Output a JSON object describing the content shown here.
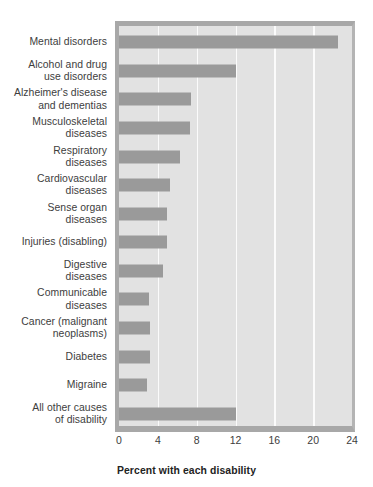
{
  "chart_data": {
    "type": "bar",
    "orientation": "horizontal",
    "title": "",
    "xlabel": "Percent with each disability",
    "ylabel": "",
    "xlim": [
      0,
      24
    ],
    "xticks": [
      0,
      4,
      8,
      12,
      16,
      20,
      24
    ],
    "xtick_labels": [
      "0",
      "4",
      "8",
      "12",
      "16",
      "20",
      "24"
    ],
    "grid": true,
    "grid_axis": "x",
    "legend": false,
    "categories": [
      "Mental disorders",
      "Alcohol and drug\nuse disorders",
      "Alzheimer's disease\nand dementias",
      "Musculoskeletal\ndiseases",
      "Respiratory\ndiseases",
      "Cardiovascular\ndiseases",
      "Sense organ\ndiseases",
      "Injuries (disabling)",
      "Digestive\ndiseases",
      "Communicable\ndiseases",
      "Cancer (malignant\nneoplasms)",
      "Diabetes",
      "Migraine",
      "All other causes\nof disability"
    ],
    "values": [
      22.6,
      12.0,
      7.4,
      7.3,
      6.3,
      5.3,
      4.9,
      4.9,
      4.5,
      3.1,
      3.2,
      3.2,
      2.9,
      12.0
    ],
    "bar_color": "#9a9a9a",
    "plot_background": "#e2e2e2",
    "gridline_color": "#fbfbfb"
  }
}
